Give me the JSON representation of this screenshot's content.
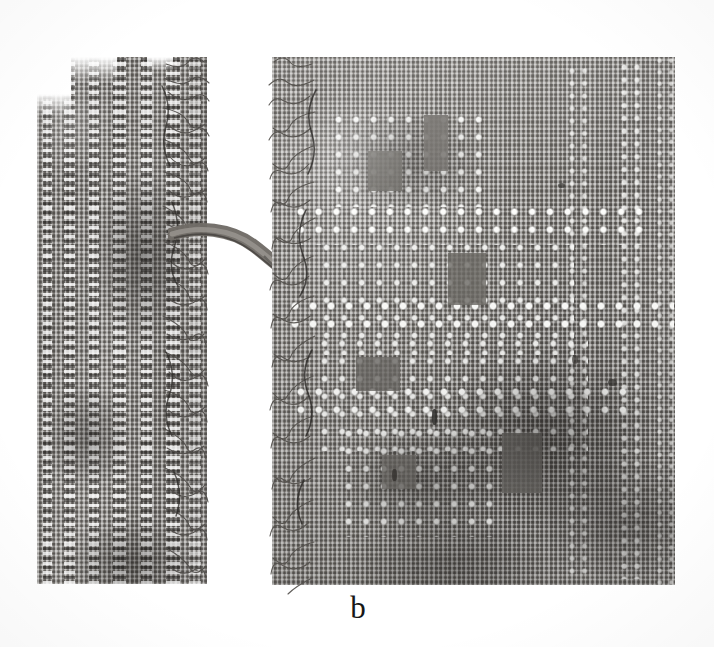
{
  "figure": {
    "panel_label": "b",
    "caption_position": "bottom-center",
    "media": "grayscale photograph",
    "background_color": "#ffffff"
  },
  "canvas": {
    "width": 714,
    "height": 647
  },
  "specimens": [
    {
      "id": "left-fragment",
      "name": "left textile fragment",
      "x": 37,
      "y": 57,
      "width": 170,
      "height": 527,
      "description": "narrow strip, vertical openwork stripes, heavily frayed right selvedge with loose curled threads",
      "base_color": "#87847f",
      "edge": "frayed-right",
      "stripes": [
        {
          "x": 6,
          "width": 9
        },
        {
          "x": 27,
          "width": 11
        },
        {
          "x": 52,
          "width": 10
        },
        {
          "x": 76,
          "width": 13
        },
        {
          "x": 104,
          "width": 11
        },
        {
          "x": 129,
          "width": 14
        },
        {
          "x": 152,
          "width": 12
        }
      ]
    },
    {
      "id": "right-fragment",
      "name": "right textile fragment",
      "x": 272,
      "y": 57,
      "width": 403,
      "height": 528,
      "description": "larger panel with blocks of square openwork forming a stepped motif; frayed left selvedge; vertical openwork bands near right edge",
      "base_color": "#8a8783",
      "edge": "frayed-left",
      "openwork_blocks": [
        {
          "name": "upper-small-block",
          "x": 62,
          "y": 58,
          "width": 148,
          "height": 92
        },
        {
          "name": "central-wide-band",
          "x": 28,
          "y": 150,
          "width": 340,
          "height": 38
        },
        {
          "name": "central-main-block",
          "x": 50,
          "y": 186,
          "width": 252,
          "height": 108
        },
        {
          "name": "mid-wide-band",
          "x": 20,
          "y": 244,
          "width": 378,
          "height": 34
        },
        {
          "name": "lower-main-block",
          "x": 48,
          "y": 282,
          "width": 268,
          "height": 110
        },
        {
          "name": "lower-wide-band",
          "x": 26,
          "y": 330,
          "width": 330,
          "height": 32
        },
        {
          "name": "bottom-block",
          "x": 72,
          "y": 372,
          "width": 150,
          "height": 106
        }
      ],
      "vertical_bands": [
        {
          "name": "right-band-inner",
          "x": 300,
          "width": 18
        },
        {
          "name": "right-band-outer",
          "x": 352,
          "width": 22
        },
        {
          "name": "right-selvedge",
          "x": 386,
          "width": 14
        }
      ]
    }
  ],
  "features": [
    {
      "id": "bridging-yarn",
      "name": "bridging yarn between fragments",
      "description": "single thick twisted thread spanning the white gap from the left fragment's selvedge to the right fragment's selvedge"
    },
    {
      "id": "gap",
      "name": "white background gap",
      "x": 207,
      "y": 57,
      "width": 65,
      "height": 528
    }
  ],
  "palette": {
    "paper_white": "#ffffff",
    "fabric_light": "#9a9793",
    "fabric_mid": "#85827e",
    "fabric_dark": "#565350",
    "hole_highlight": "#fbfbf9",
    "thread_dark": "#3a3835",
    "caption_ink": "#171717"
  }
}
